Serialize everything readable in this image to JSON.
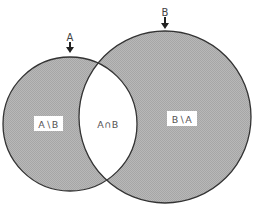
{
  "diagram": {
    "type": "venn",
    "colors": {
      "fill": "#b3b3b3",
      "stroke": "#333333",
      "intersection": "#ffffff",
      "label_box": "#ffffff",
      "text": "#444444"
    },
    "sets": [
      {
        "id": "A",
        "label": "A",
        "cx": 70,
        "cy": 124,
        "r": 67
      },
      {
        "id": "B",
        "label": "B",
        "cx": 165,
        "cy": 117,
        "r": 86
      }
    ],
    "regions": {
      "a_minus_b": "A∖B",
      "intersection": "A∩B",
      "b_minus_a": "B∖A"
    }
  }
}
